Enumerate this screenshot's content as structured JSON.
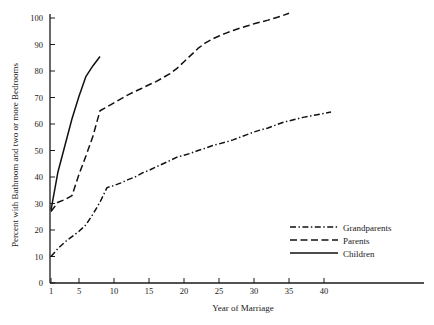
{
  "chart_data": {
    "type": "line",
    "title": "",
    "xlabel": "Year of Marriage",
    "ylabel": "Percent with Bathroom and two or more Bedrooms",
    "xlim": [
      1,
      42
    ],
    "ylim": [
      0,
      104
    ],
    "grid": false,
    "legend_position": "lower-right",
    "xticks": [
      1,
      5,
      10,
      15,
      20,
      25,
      30,
      35,
      40
    ],
    "xtick_labels": [
      "1",
      "5",
      "10",
      "15",
      "20",
      "25",
      "30",
      "35",
      "40"
    ],
    "yticks": [
      0,
      10,
      20,
      30,
      40,
      50,
      60,
      70,
      80,
      90,
      100
    ],
    "ytick_labels": [
      "0",
      "10",
      "20",
      "30",
      "40",
      "50",
      "60",
      "70",
      "80",
      "90",
      "100"
    ],
    "series": [
      {
        "name": "Grandparents",
        "style": "dash-dot",
        "color": "#111111",
        "x": [
          1,
          2,
          3,
          4,
          5,
          6,
          7,
          8,
          9,
          10,
          11,
          12,
          13,
          14,
          15,
          16,
          17,
          18,
          19,
          20,
          21,
          22,
          23,
          24,
          25,
          26,
          27,
          28,
          29,
          30,
          31,
          32,
          33,
          34,
          35,
          36,
          37,
          38,
          39,
          40,
          41
        ],
        "values": [
          10.0,
          13.0,
          15.5,
          17.5,
          19.5,
          22.0,
          26.0,
          30.5,
          36.0,
          36.8,
          37.8,
          39.0,
          40.0,
          41.5,
          42.5,
          43.8,
          45.0,
          46.2,
          47.5,
          48.2,
          49.0,
          50.0,
          50.8,
          51.8,
          52.5,
          53.2,
          54.0,
          55.0,
          56.0,
          57.0,
          57.8,
          58.5,
          59.5,
          60.5,
          61.2,
          61.8,
          62.5,
          63.0,
          63.5,
          64.0,
          64.5
        ]
      },
      {
        "name": "Parents",
        "style": "dashed",
        "color": "#111111",
        "x": [
          1,
          2,
          3,
          4,
          5,
          6,
          7,
          8,
          9,
          10,
          11,
          12,
          13,
          14,
          15,
          16,
          17,
          18,
          19,
          20,
          21,
          22,
          23,
          24,
          25,
          26,
          27,
          28,
          29,
          30,
          31,
          32,
          33,
          34,
          35
        ],
        "values": [
          27.0,
          30.5,
          31.5,
          33.0,
          41.0,
          48.0,
          55.5,
          65.0,
          66.5,
          68.0,
          69.5,
          71.0,
          72.3,
          73.5,
          74.8,
          76.0,
          77.5,
          79.0,
          81.0,
          83.5,
          86.0,
          88.5,
          90.5,
          92.0,
          93.2,
          94.3,
          95.3,
          96.2,
          97.0,
          97.8,
          98.5,
          99.2,
          100.0,
          100.8,
          101.8
        ]
      },
      {
        "name": "Children",
        "style": "solid",
        "color": "#111111",
        "x": [
          1,
          2,
          3,
          4,
          5,
          6,
          7,
          8
        ],
        "values": [
          27.5,
          42.0,
          52.0,
          62.0,
          70.5,
          78.0,
          82.0,
          85.5
        ]
      }
    ]
  },
  "legend": {
    "items": [
      {
        "label": "Grandparents",
        "style": "dash-dot"
      },
      {
        "label": "Parents",
        "style": "dashed"
      },
      {
        "label": "Children",
        "style": "solid"
      }
    ]
  }
}
